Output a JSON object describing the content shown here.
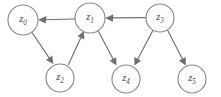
{
  "diagram": {
    "type": "directed-graph",
    "title": "",
    "canvas": {
      "width": 221,
      "height": 97,
      "background": "#ffffff"
    },
    "style": {
      "node_fill": "#ffffff",
      "node_stroke": "#8a8a8a",
      "edge_stroke": "#6f6f6f",
      "label_color": "#4a4a4a",
      "node_radius": 15
    },
    "nodes": [
      {
        "id": "z0",
        "base": "z",
        "subscript": "0",
        "cx": 23,
        "cy": 20,
        "r": 15
      },
      {
        "id": "z1",
        "base": "z",
        "subscript": "1",
        "cx": 90,
        "cy": 18,
        "r": 15
      },
      {
        "id": "z2",
        "base": "z",
        "subscript": "2",
        "cx": 60,
        "cy": 78,
        "r": 14
      },
      {
        "id": "z3",
        "base": "z",
        "subscript": "3",
        "cx": 160,
        "cy": 18,
        "r": 14
      },
      {
        "id": "z4",
        "base": "z",
        "subscript": "4",
        "cx": 126,
        "cy": 79,
        "r": 14
      },
      {
        "id": "z5",
        "base": "z",
        "subscript": "5",
        "cx": 192,
        "cy": 79,
        "r": 14
      }
    ],
    "edges": [
      {
        "id": "e1",
        "from": "z1",
        "to": "z0",
        "directed": true
      },
      {
        "id": "e2",
        "from": "z3",
        "to": "z1",
        "directed": true
      },
      {
        "id": "e3",
        "from": "z0",
        "to": "z2",
        "directed": true
      },
      {
        "id": "e4",
        "from": "z2",
        "to": "z1",
        "directed": true
      },
      {
        "id": "e5",
        "from": "z1",
        "to": "z4",
        "directed": true
      },
      {
        "id": "e6",
        "from": "z3",
        "to": "z4",
        "directed": true
      },
      {
        "id": "e7",
        "from": "z3",
        "to": "z5",
        "directed": true
      }
    ]
  }
}
